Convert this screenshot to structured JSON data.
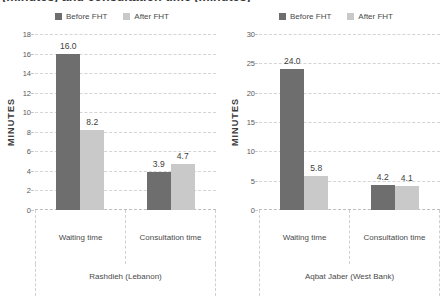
{
  "figure": {
    "clipped_title": "(minutes) and consultation time (minutes)"
  },
  "legend": {
    "items": [
      {
        "label": "Before FHT",
        "color": "#6e6e6e"
      },
      {
        "label": "After FHT",
        "color": "#c9c9c9"
      }
    ]
  },
  "chart_data": [
    {
      "type": "bar",
      "title": "Rashdieh (Lebanon)",
      "categories": [
        "Waiting time",
        "Consultation time"
      ],
      "series": [
        {
          "name": "Before FHT",
          "values": [
            16.0,
            3.9
          ],
          "color": "#6e6e6e"
        },
        {
          "name": "After FHT",
          "values": [
            8.2,
            4.7
          ],
          "color": "#c9c9c9"
        }
      ],
      "value_labels": [
        [
          "16.0",
          "3.9"
        ],
        [
          "8.2",
          "4.7"
        ]
      ],
      "xlabel": "",
      "ylabel": "MINUTES",
      "ylim": [
        0,
        18
      ],
      "yticks": [
        0,
        2,
        4,
        6,
        8,
        10,
        12,
        14,
        16,
        18
      ],
      "grid": true,
      "legend_position": "top-center"
    },
    {
      "type": "bar",
      "title": "Aqbat Jaber (West Bank)",
      "categories": [
        "Waiting time",
        "Consultation time"
      ],
      "series": [
        {
          "name": "Before FHT",
          "values": [
            24.0,
            4.2
          ],
          "color": "#6e6e6e"
        },
        {
          "name": "After FHT",
          "values": [
            5.8,
            4.1
          ],
          "color": "#c9c9c9"
        }
      ],
      "value_labels": [
        [
          "24.0",
          "4.2"
        ],
        [
          "5.8",
          "4.1"
        ]
      ],
      "xlabel": "",
      "ylabel": "MINUTES",
      "ylim": [
        0,
        30
      ],
      "yticks": [
        0,
        5,
        10,
        15,
        20,
        25,
        30
      ],
      "grid": true,
      "legend_position": "top-center"
    }
  ]
}
